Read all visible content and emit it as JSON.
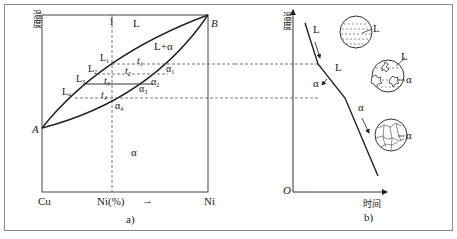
{
  "panel_a": {
    "caption": "a)",
    "y_axis_label": "温度",
    "x_left_label": "Cu",
    "x_mid_label": "Ni(%)",
    "x_arrow": "→",
    "x_right_label": "Ni",
    "vertical_line_label": "I",
    "point_A": "A",
    "point_B": "B",
    "region_liquid": "L",
    "region_two_phase": "L+α",
    "region_solid": "α",
    "liquidus_points": [
      "L1",
      "L2",
      "L3",
      "L4"
    ],
    "solidus_points": [
      "α1",
      "α2",
      "α3",
      "α4"
    ],
    "temperatures": [
      "t1",
      "t2",
      "t3",
      "t4"
    ]
  },
  "panel_b": {
    "caption": "b)",
    "y_axis_label": "温度",
    "x_axis_label": "时间",
    "origin_label": "O",
    "curve_labels": {
      "liquid_segment": "L",
      "transition_L": "L",
      "transition_alpha": "α",
      "solid_segment": "α"
    },
    "microstructures": [
      {
        "name": "liquid",
        "label": "L"
      },
      {
        "name": "liquid-plus-dendrites",
        "labels": [
          "L",
          "α"
        ]
      },
      {
        "name": "solid-grains",
        "label": "α"
      }
    ]
  }
}
